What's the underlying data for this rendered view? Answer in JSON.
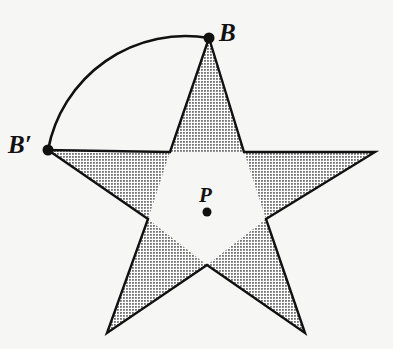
{
  "figure": {
    "background_color": "#f6f6f4",
    "stroke_color": "#111111",
    "shade_color": "#9a9a9a",
    "inner_fill_color": "#f6f6f4",
    "stroke_width": 2.4
  },
  "labels": {
    "b": "B",
    "b_prime": "B′",
    "p": "P"
  },
  "points": {
    "B": {
      "x": 209,
      "y": 38,
      "name": "star-point-top",
      "label": "B"
    },
    "B_prime": {
      "x": 48,
      "y": 150,
      "name": "star-point-upper-left",
      "label": "B′"
    },
    "right": {
      "x": 375,
      "y": 152,
      "name": "star-point-upper-right",
      "label": ""
    },
    "bottom_left": {
      "x": 107,
      "y": 333,
      "name": "star-point-lower-left",
      "label": ""
    },
    "bottom_right": {
      "x": 305,
      "y": 333,
      "name": "star-point-lower-right",
      "label": ""
    },
    "P": {
      "x": 207,
      "y": 212,
      "name": "center-point",
      "label": "P"
    }
  },
  "inner_pentagon": [
    {
      "x": 170,
      "y": 152
    },
    {
      "x": 244,
      "y": 152
    },
    {
      "x": 266,
      "y": 219
    },
    {
      "x": 207,
      "y": 265
    },
    {
      "x": 148,
      "y": 219
    }
  ],
  "arc": {
    "from": "B_prime",
    "to": "B",
    "center": "P",
    "radius": 140,
    "sweep": "clockwise",
    "path": "M 48 150 A 140 140 0 0 1 209 38"
  },
  "dots": [
    {
      "name": "dot-B",
      "x": 209,
      "y": 38,
      "r": 5.5
    },
    {
      "name": "dot-B-prime",
      "x": 48,
      "y": 150,
      "r": 5.5
    },
    {
      "name": "dot-P",
      "x": 207,
      "y": 212,
      "r": 4.5
    }
  ],
  "shaded_arms": [
    {
      "name": "star-arm-top",
      "path": "M 209 38 L 244 152 L 170 152 Z"
    },
    {
      "name": "star-arm-upper-left",
      "path": "M 48 150 L 170 152 L 148 219 Z"
    },
    {
      "name": "star-arm-upper-right",
      "path": "M 375 152 L 266 219 L 244 152 Z"
    },
    {
      "name": "star-arm-lower-left",
      "path": "M 107 333 L 148 219 L 207 265 Z"
    },
    {
      "name": "star-arm-lower-right",
      "path": "M 305 333 L 207 265 L 266 219 Z"
    }
  ],
  "star_outline": "M 209 38 L 244 152 L 375 152 L 266 219 L 305 333 L 207 265 L 107 333 L 148 219 L 48 150 L 170 152 Z"
}
